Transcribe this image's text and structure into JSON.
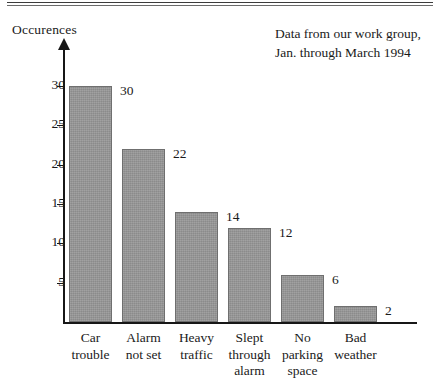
{
  "chart_data": {
    "type": "bar",
    "title": "",
    "subtitle": "",
    "xlabel": "",
    "ylabel": "Occurences",
    "categories": [
      "Car trouble",
      "Alarm not set",
      "Heavy traffic",
      "Slept through alarm",
      "No parking space",
      "Bad weather"
    ],
    "category_lines": [
      [
        "Car",
        "trouble"
      ],
      [
        "Alarm",
        "not set"
      ],
      [
        "Heavy",
        "traffic"
      ],
      [
        "Slept",
        "through",
        "alarm"
      ],
      [
        "No",
        "parking",
        "space"
      ],
      [
        "Bad",
        "weather"
      ]
    ],
    "values": [
      30,
      22,
      14,
      12,
      6,
      2
    ],
    "value_labels": [
      "30",
      "22",
      "14",
      "12",
      "6",
      "2"
    ],
    "ylim": [
      0,
      32
    ],
    "yticks": [
      5,
      10,
      15,
      20,
      25,
      30
    ],
    "ytick_labels": [
      "5",
      "10",
      "15",
      "20",
      "25",
      "30"
    ],
    "grid": false,
    "legend": false,
    "bar_color": "#979797",
    "axis_color": "#171717",
    "annotation": [
      "Data from our work group,",
      "Jan. through March 1994"
    ]
  },
  "figure": {
    "annotation_line1": "Data from our work group,",
    "annotation_line2": "Jan. through March 1994",
    "y_axis_title": "Occurences"
  }
}
